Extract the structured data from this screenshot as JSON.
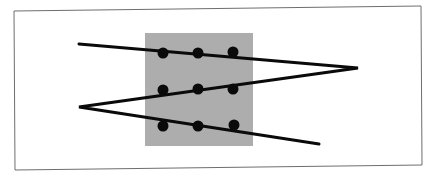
{
  "diagram": {
    "colors": {
      "background": "#ffffff",
      "frame": "#6e6e6e",
      "square": "#adadad",
      "dot": "#0a0a0a",
      "line": "#0a0a0a"
    },
    "frame": {
      "points": "14,11 421,6 422,165 15,170"
    },
    "square": {
      "x": 145,
      "y": 33,
      "width": 108,
      "height": 113
    },
    "dots": [
      {
        "cx": 163,
        "cy": 53
      },
      {
        "cx": 198,
        "cy": 53
      },
      {
        "cx": 233,
        "cy": 52
      },
      {
        "cx": 163,
        "cy": 90
      },
      {
        "cx": 198,
        "cy": 89
      },
      {
        "cx": 233,
        "cy": 89
      },
      {
        "cx": 163,
        "cy": 126
      },
      {
        "cx": 198,
        "cy": 126
      },
      {
        "cx": 234,
        "cy": 125
      }
    ],
    "dot_radius": 5.5,
    "path": {
      "points": "79,44 358,68 79,107 319,144",
      "stroke_width": 3
    }
  }
}
